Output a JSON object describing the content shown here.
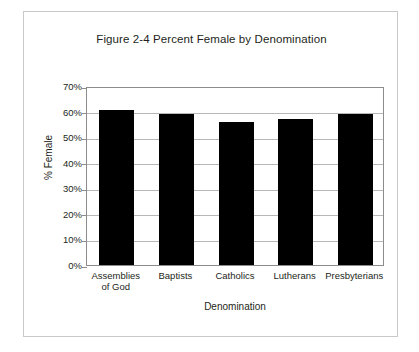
{
  "figure": {
    "title": "Figure 2-4 Percent Female by Denomination"
  },
  "chart_data": {
    "type": "bar",
    "title": "Figure 2-4 Percent Female by Denomination",
    "xlabel": "Denomination",
    "ylabel": "% Female",
    "categories": [
      "Assemblies\nof God",
      "Baptists",
      "Catholics",
      "Lutherans",
      "Presbyterians"
    ],
    "values": [
      60.5,
      59,
      56,
      57,
      59
    ],
    "ylim": [
      0,
      70
    ],
    "ytick_labels": [
      "70%",
      "60%",
      "50%",
      "40%",
      "30%",
      "20%",
      "10%",
      "0%"
    ],
    "ytick_values": [
      70,
      60,
      50,
      40,
      30,
      20,
      10,
      0
    ],
    "grid": true,
    "legend": "none",
    "bar_color": "#000000",
    "gridline_color": "#b7b7b7",
    "axis_color": "#8c8c8c"
  }
}
